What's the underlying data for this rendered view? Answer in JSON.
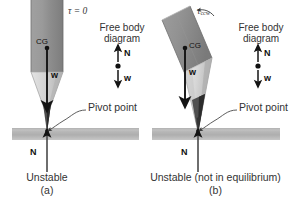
{
  "figure": {
    "background": "#ffffff",
    "colors": {
      "pencil_body_dark": "#8f8f8f",
      "pencil_body_light": "#bdbdbd",
      "pencil_wood": "#d8d8d8",
      "pencil_wood_shadow": "#a8a8a8",
      "graphite": "#4a4a4a",
      "graphite_dark": "#2e2e2e",
      "ground": "#b5b5b5",
      "arrow": "#1a1a1a",
      "text": "#333333"
    }
  },
  "panels": [
    {
      "id": "a",
      "torque_label": "τ = 0",
      "torque_subscript": "",
      "cg_label": "CG",
      "weight_label": "w",
      "pivot_label": "Pivot point",
      "normal_label": "N",
      "status_label": "Unstable",
      "panel_letter": "(a)",
      "fbd": {
        "title_line1": "Free body",
        "title_line2": "diagram",
        "up_force_label": "N",
        "down_force_label": "w"
      }
    },
    {
      "id": "b",
      "torque_label": "τ",
      "torque_subscript": "ccw",
      "cg_label": "CG",
      "weight_label": "w",
      "pivot_label": "Pivot point",
      "normal_label": "N",
      "status_label": "Unstable (not in equilibrium)",
      "panel_letter": "(b)",
      "fbd": {
        "title_line1": "Free body",
        "title_line2": "diagram",
        "up_force_label": "N",
        "down_force_label": "w"
      }
    }
  ]
}
